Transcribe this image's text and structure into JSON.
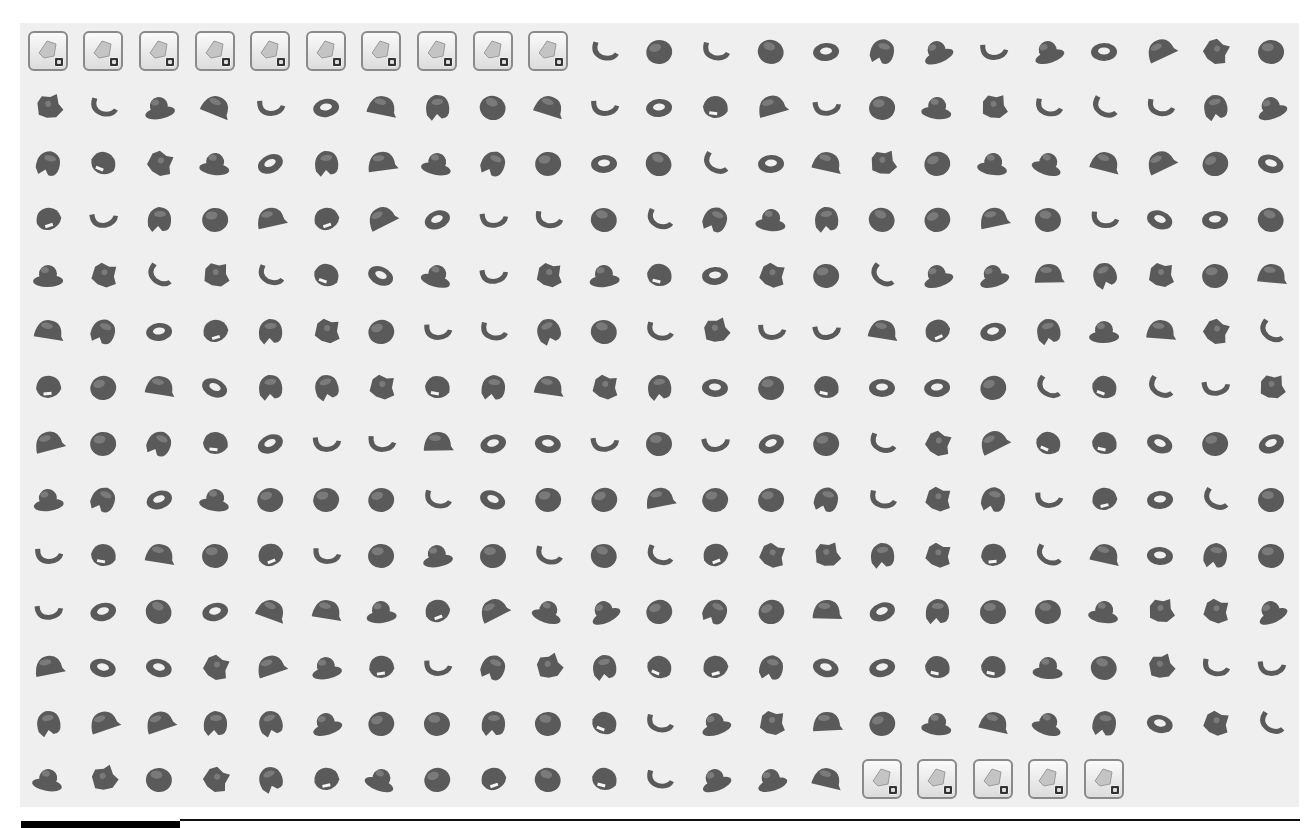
{
  "panel": {
    "background": "#efefef",
    "columns": 23,
    "rows": 14,
    "part_color": "#5a5a5a",
    "part_highlight": "#7a7a7a"
  },
  "category_buttons_top": [
    {
      "icon": "vehicle-part-icon"
    },
    {
      "icon": "bracket-part-icon"
    },
    {
      "icon": "wing-part-icon"
    },
    {
      "icon": "gear-wheel-part-icon"
    },
    {
      "icon": "ladder-part-icon"
    },
    {
      "icon": "cylinder-part-icon"
    },
    {
      "icon": "minifigure-part-icon"
    },
    {
      "icon": "round-brick-part-icon"
    },
    {
      "icon": "dome-part-icon"
    },
    {
      "icon": "dish-part-icon"
    }
  ],
  "category_buttons_bottom": [
    {
      "icon": "skeleton-part-icon"
    },
    {
      "icon": "plant-part-icon"
    },
    {
      "icon": "tool-part-icon"
    },
    {
      "icon": "hair-part-icon"
    },
    {
      "icon": "animal-part-icon"
    }
  ],
  "grid_rows": [
    {
      "tiles": 10,
      "parts": 13
    },
    {
      "tiles": 0,
      "parts": 23
    },
    {
      "tiles": 0,
      "parts": 23
    },
    {
      "tiles": 0,
      "parts": 23
    },
    {
      "tiles": 0,
      "parts": 23
    },
    {
      "tiles": 0,
      "parts": 23
    },
    {
      "tiles": 0,
      "parts": 23
    },
    {
      "tiles": 0,
      "parts": 23
    },
    {
      "tiles": 0,
      "parts": 23
    },
    {
      "tiles": 0,
      "parts": 23
    },
    {
      "tiles": 0,
      "parts": 23
    },
    {
      "tiles": 0,
      "parts": 23
    },
    {
      "tiles": 0,
      "parts": 23
    },
    {
      "tiles": 0,
      "parts": 15,
      "trailing_tiles": 5
    }
  ],
  "part_shapes": [
    "helmet",
    "cap",
    "hair",
    "hook",
    "ring",
    "hat",
    "visor",
    "blob"
  ]
}
